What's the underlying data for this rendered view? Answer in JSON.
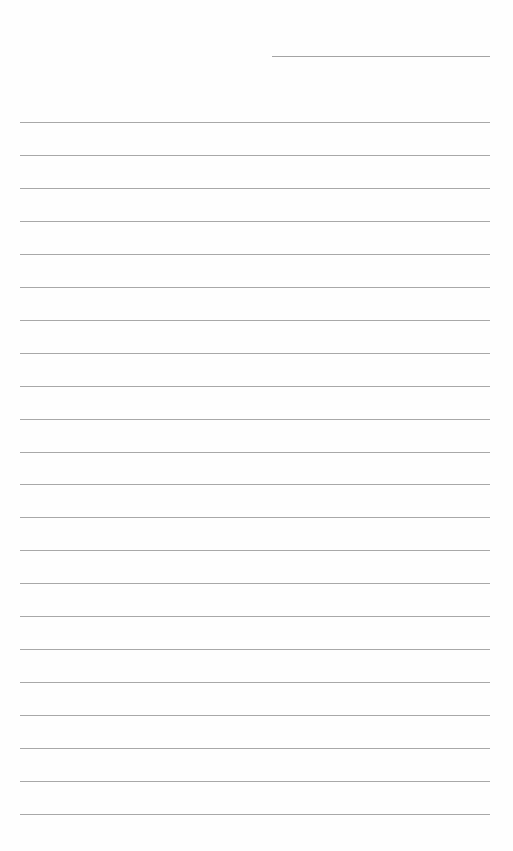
{
  "page": {
    "type": "lined-paper",
    "header_line": {
      "label": ""
    },
    "line_count": 22,
    "first_line_y": 122,
    "line_spacing": 32.95,
    "lines": [
      "",
      "",
      "",
      "",
      "",
      "",
      "",
      "",
      "",
      "",
      "",
      "",
      "",
      "",
      "",
      "",
      "",
      "",
      "",
      "",
      "",
      ""
    ]
  },
  "colors": {
    "background": "#fefefe",
    "rule": "#a8a8a8"
  }
}
